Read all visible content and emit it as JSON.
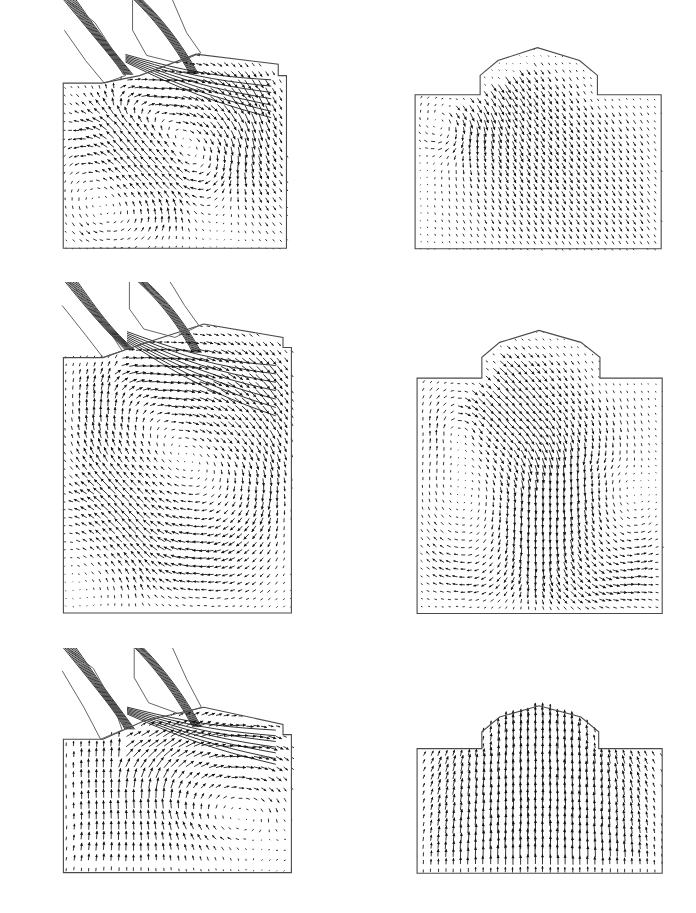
{
  "figure": {
    "title": "In-cylinder velocity vector fields",
    "background_color": "#ffffff",
    "vector_color": "#111111",
    "wall_color": "#4a4a4a",
    "rows": 3,
    "columns": 2,
    "width_px": 696,
    "height_px": 913
  },
  "chart_data": {
    "type": "quiver",
    "title": "In-cylinder velocity vector fields",
    "xlabel": "",
    "ylabel": "",
    "grid": false,
    "legend": null,
    "panels": [
      {
        "id": "panel-top-left",
        "row": 1,
        "column": 1,
        "geometry": "cylinder-with-intake-port",
        "chamber_outline": [
          [
            0.035,
            0.33
          ],
          [
            0.035,
            0.985
          ],
          [
            0.985,
            0.985
          ],
          [
            0.985,
            0.3
          ],
          [
            0.95,
            0.3
          ],
          [
            0.95,
            0.255
          ],
          [
            0.6,
            0.215
          ],
          [
            0.36,
            0.3
          ],
          [
            0.2,
            0.33
          ]
        ],
        "port_outline": [
          [
            0.05,
            0.0
          ],
          [
            0.17,
            0.09
          ],
          [
            0.26,
            0.22
          ],
          [
            0.3,
            0.3
          ],
          [
            0.21,
            0.33
          ],
          [
            0.13,
            0.24
          ],
          [
            0.04,
            0.12
          ]
        ],
        "port_outline_2": [
          [
            0.33,
            0.0
          ],
          [
            0.33,
            0.12
          ],
          [
            0.39,
            0.22
          ],
          [
            0.52,
            0.25
          ],
          [
            0.62,
            0.21
          ],
          [
            0.56,
            0.13
          ],
          [
            0.5,
            0.0
          ]
        ],
        "vortices": [
          {
            "cx": 0.56,
            "cy": 0.44,
            "strength": 1.0,
            "sense": "cw",
            "radius": 0.3
          },
          {
            "cx": 0.28,
            "cy": 0.73,
            "strength": 0.72,
            "sense": "ccw",
            "radius": 0.26
          }
        ],
        "jet": {
          "origin": [
            0.3,
            0.3
          ],
          "direction": [
            0.86,
            0.5
          ],
          "speed": 1.0,
          "spread": 0.16
        },
        "max_speed_rel": 1.0,
        "nx": 34,
        "ny": 30
      },
      {
        "id": "panel-top-right",
        "row": 1,
        "column": 2,
        "geometry": "symmetric-pent-roof-bowl",
        "chamber_outline": [
          [
            0.02,
            0.265
          ],
          [
            0.02,
            0.985
          ],
          [
            0.985,
            0.985
          ],
          [
            0.985,
            0.265
          ],
          [
            0.735,
            0.265
          ],
          [
            0.735,
            0.175
          ],
          [
            0.665,
            0.105
          ],
          [
            0.5,
            0.045
          ],
          [
            0.345,
            0.105
          ],
          [
            0.275,
            0.175
          ],
          [
            0.275,
            0.265
          ]
        ],
        "vortices": [
          {
            "cx": 0.155,
            "cy": 0.36,
            "strength": 0.7,
            "sense": "cw",
            "radius": 0.15
          }
        ],
        "jet": {
          "origin": [
            0.305,
            0.225
          ],
          "direction": [
            0.55,
            0.84
          ],
          "speed": 1.0,
          "spread": 0.3
        },
        "max_speed_rel": 1.0,
        "nx": 36,
        "ny": 30
      },
      {
        "id": "panel-middle-left",
        "row": 2,
        "column": 1,
        "geometry": "cylinder-with-intake-port-deep",
        "chamber_outline": [
          [
            0.035,
            0.225
          ],
          [
            0.035,
            0.985
          ],
          [
            0.985,
            0.985
          ],
          [
            0.985,
            0.195
          ],
          [
            0.95,
            0.195
          ],
          [
            0.95,
            0.165
          ],
          [
            0.62,
            0.125
          ],
          [
            0.36,
            0.185
          ],
          [
            0.2,
            0.225
          ]
        ],
        "port_outline": [
          [
            0.06,
            0.0
          ],
          [
            0.155,
            0.07
          ],
          [
            0.23,
            0.15
          ],
          [
            0.28,
            0.205
          ],
          [
            0.2,
            0.225
          ],
          [
            0.13,
            0.16
          ],
          [
            0.03,
            0.07
          ]
        ],
        "port_outline_2": [
          [
            0.31,
            0.0
          ],
          [
            0.31,
            0.08
          ],
          [
            0.37,
            0.14
          ],
          [
            0.5,
            0.165
          ],
          [
            0.6,
            0.13
          ],
          [
            0.54,
            0.07
          ],
          [
            0.48,
            0.0
          ]
        ],
        "vortices": [
          {
            "cx": 0.565,
            "cy": 0.43,
            "strength": 1.0,
            "sense": "cw",
            "radius": 0.4
          },
          {
            "cx": 0.185,
            "cy": 0.82,
            "strength": 0.55,
            "sense": "ccw",
            "radius": 0.2
          }
        ],
        "jet": {
          "origin": [
            0.28,
            0.2
          ],
          "direction": [
            0.92,
            0.38
          ],
          "speed": 0.95,
          "spread": 0.14
        },
        "max_speed_rel": 0.95,
        "nx": 34,
        "ny": 42
      },
      {
        "id": "panel-middle-right",
        "row": 2,
        "column": 2,
        "geometry": "symmetric-pent-roof-bowl",
        "chamber_outline": [
          [
            0.02,
            0.195
          ],
          [
            0.02,
            0.985
          ],
          [
            0.985,
            0.985
          ],
          [
            0.985,
            0.195
          ],
          [
            0.74,
            0.195
          ],
          [
            0.74,
            0.125
          ],
          [
            0.665,
            0.075
          ],
          [
            0.5,
            0.035
          ],
          [
            0.345,
            0.075
          ],
          [
            0.275,
            0.125
          ],
          [
            0.275,
            0.195
          ]
        ],
        "vortices": [
          {
            "cx": 0.155,
            "cy": 0.265,
            "strength": 0.65,
            "sense": "cw",
            "radius": 0.14
          },
          {
            "cx": 0.7,
            "cy": 0.7,
            "strength": 0.95,
            "sense": "ccw",
            "radius": 0.24
          },
          {
            "cx": 0.3,
            "cy": 0.6,
            "strength": 0.85,
            "sense": "cw",
            "radius": 0.3
          }
        ],
        "jet": {
          "origin": [
            0.3,
            0.16
          ],
          "direction": [
            0.72,
            0.69
          ],
          "speed": 1.0,
          "spread": 0.22
        },
        "max_speed_rel": 1.0,
        "nx": 36,
        "ny": 40
      },
      {
        "id": "panel-bottom-left",
        "row": 3,
        "column": 1,
        "geometry": "cylinder-with-intake-port-shallow",
        "chamber_outline": [
          [
            0.035,
            0.4
          ],
          [
            0.035,
            0.985
          ],
          [
            0.985,
            0.985
          ],
          [
            0.985,
            0.38
          ],
          [
            0.95,
            0.38
          ],
          [
            0.95,
            0.335
          ],
          [
            0.62,
            0.26
          ],
          [
            0.37,
            0.32
          ],
          [
            0.2,
            0.4
          ]
        ],
        "port_outline": [
          [
            0.05,
            0.0
          ],
          [
            0.16,
            0.09
          ],
          [
            0.24,
            0.24
          ],
          [
            0.28,
            0.36
          ],
          [
            0.19,
            0.4
          ],
          [
            0.12,
            0.26
          ],
          [
            0.03,
            0.1
          ]
        ],
        "port_outline_2": [
          [
            0.33,
            0.0
          ],
          [
            0.33,
            0.13
          ],
          [
            0.39,
            0.24
          ],
          [
            0.52,
            0.29
          ],
          [
            0.61,
            0.26
          ],
          [
            0.55,
            0.14
          ],
          [
            0.49,
            0.0
          ]
        ],
        "vortices": [
          {
            "cx": 0.7,
            "cy": 0.56,
            "strength": 0.85,
            "sense": "cw",
            "radius": 0.28
          }
        ],
        "jet": {
          "origin": [
            0.3,
            0.38
          ],
          "direction": [
            0.8,
            0.25
          ],
          "speed": 0.9,
          "spread": 0.2
        },
        "upflow": 0.85,
        "max_speed_rel": 0.9,
        "nx": 32,
        "ny": 22
      },
      {
        "id": "panel-bottom-right",
        "row": 3,
        "column": 2,
        "geometry": "symmetric-pent-roof-bowl",
        "chamber_outline": [
          [
            0.02,
            0.315
          ],
          [
            0.02,
            0.985
          ],
          [
            0.985,
            0.985
          ],
          [
            0.985,
            0.315
          ],
          [
            0.735,
            0.315
          ],
          [
            0.735,
            0.225
          ],
          [
            0.665,
            0.145
          ],
          [
            0.5,
            0.085
          ],
          [
            0.345,
            0.145
          ],
          [
            0.275,
            0.225
          ],
          [
            0.275,
            0.315
          ]
        ],
        "vortices": [],
        "squish": {
          "center_x": 0.5,
          "speed": 1.0
        },
        "max_speed_rel": 1.0,
        "nx": 34,
        "ny": 24
      }
    ]
  },
  "panel_labels": {
    "top_left": "",
    "top_right": "",
    "middle_left": "",
    "middle_right": "",
    "bottom_left": "",
    "bottom_right": ""
  }
}
